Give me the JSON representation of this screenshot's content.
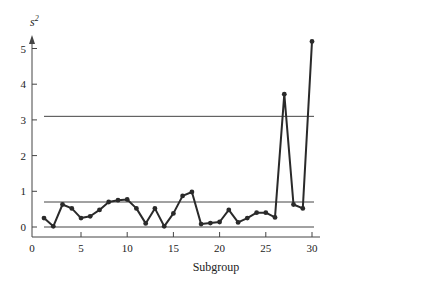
{
  "chart_data": {
    "type": "line",
    "title": "",
    "xlabel": "Subgroup",
    "ylabel": "s²",
    "ylabel_base": "s",
    "ylabel_sup": "2",
    "xlim": [
      0,
      30
    ],
    "ylim": [
      0,
      5.3
    ],
    "xticks": [
      0,
      5,
      10,
      15,
      20,
      25,
      30
    ],
    "yticks": [
      0,
      1,
      2,
      3,
      4,
      5
    ],
    "grid": false,
    "legend": null,
    "control_lines": {
      "UCL": 3.1,
      "center": 0.7,
      "LCL": 0
    },
    "series": [
      {
        "name": "s²",
        "x": [
          1,
          2,
          3,
          4,
          5,
          6,
          7,
          8,
          9,
          10,
          11,
          12,
          13,
          14,
          15,
          16,
          17,
          18,
          19,
          20,
          21,
          22,
          23,
          24,
          25,
          26,
          27,
          28,
          29,
          30
        ],
        "values": [
          0.25,
          0.02,
          0.63,
          0.52,
          0.25,
          0.3,
          0.48,
          0.7,
          0.75,
          0.77,
          0.52,
          0.1,
          0.52,
          0.02,
          0.38,
          0.87,
          0.98,
          0.08,
          0.11,
          0.14,
          0.48,
          0.13,
          0.25,
          0.4,
          0.4,
          0.27,
          3.72,
          0.63,
          0.52,
          5.2
        ]
      }
    ]
  },
  "colors": {
    "line": "#2a2a2a",
    "axis": "#444444",
    "background": "#ffffff"
  }
}
